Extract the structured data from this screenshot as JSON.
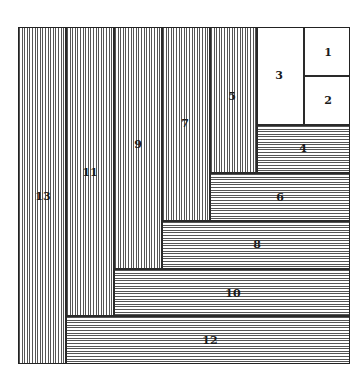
{
  "diagram": {
    "type": "spiral-rectangle-tiling",
    "frame": {
      "x": 18,
      "y": 27,
      "w": 332,
      "h": 337
    },
    "tiles": [
      {
        "label": "1",
        "fill": "plain",
        "x": 304,
        "y": 27,
        "w": 46,
        "h": 49,
        "lx": 328,
        "ly": 52
      },
      {
        "label": "2",
        "fill": "plain",
        "x": 304,
        "y": 76,
        "w": 46,
        "h": 49,
        "lx": 328,
        "ly": 100
      },
      {
        "label": "3",
        "fill": "plain",
        "x": 257,
        "y": 27,
        "w": 47,
        "h": 98,
        "lx": 279,
        "ly": 75
      },
      {
        "label": "4",
        "fill": "horiz",
        "x": 257,
        "y": 125,
        "w": 93,
        "h": 48,
        "lx": 303,
        "ly": 148
      },
      {
        "label": "5",
        "fill": "vert",
        "x": 210,
        "y": 27,
        "w": 47,
        "h": 146,
        "lx": 232,
        "ly": 96
      },
      {
        "label": "6",
        "fill": "horiz",
        "x": 210,
        "y": 173,
        "w": 140,
        "h": 48,
        "lx": 280,
        "ly": 197
      },
      {
        "label": "7",
        "fill": "vert",
        "x": 162,
        "y": 27,
        "w": 48,
        "h": 194,
        "lx": 185,
        "ly": 123
      },
      {
        "label": "8",
        "fill": "horiz",
        "x": 162,
        "y": 221,
        "w": 188,
        "h": 48,
        "lx": 257,
        "ly": 244
      },
      {
        "label": "9",
        "fill": "vert",
        "x": 114,
        "y": 27,
        "w": 48,
        "h": 242,
        "lx": 138,
        "ly": 144
      },
      {
        "label": "10",
        "fill": "horiz",
        "x": 114,
        "y": 269,
        "w": 236,
        "h": 47,
        "lx": 233,
        "ly": 293
      },
      {
        "label": "11",
        "fill": "vert",
        "x": 66,
        "y": 27,
        "w": 48,
        "h": 289,
        "lx": 90,
        "ly": 172
      },
      {
        "label": "12",
        "fill": "horiz",
        "x": 66,
        "y": 316,
        "w": 284,
        "h": 48,
        "lx": 210,
        "ly": 340
      },
      {
        "label": "13",
        "fill": "vert",
        "x": 18,
        "y": 27,
        "w": 48,
        "h": 337,
        "lx": 43,
        "ly": 196
      }
    ]
  }
}
